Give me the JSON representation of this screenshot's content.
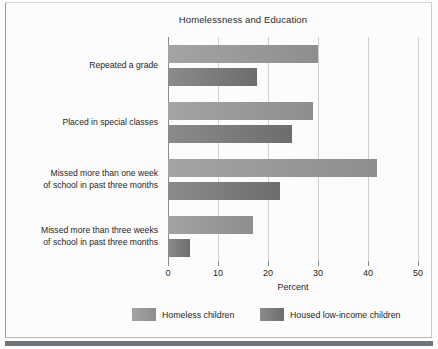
{
  "chart_data": {
    "type": "bar",
    "orientation": "horizontal",
    "title": "Homelessness and Education",
    "xlabel": "Percent",
    "ylabel": "",
    "xlim": [
      0,
      50
    ],
    "xticks": [
      0,
      10,
      20,
      30,
      40,
      50
    ],
    "xtick_labels": [
      "0",
      "10",
      "20",
      "30",
      "40",
      "50"
    ],
    "grid": "vertical",
    "legend_position": "bottom",
    "categories": [
      "Repeated a grade",
      "Placed in special classes",
      "Missed more than one week\nof school in past three months",
      "Missed more than three weeks\nof school in past three months"
    ],
    "category_lines": [
      [
        "Repeated a grade"
      ],
      [
        "Placed in special classes"
      ],
      [
        "Missed more than one week",
        "of school in past three months"
      ],
      [
        "Missed more than three weeks",
        "of school in past three months"
      ]
    ],
    "series": [
      {
        "name": "Homeless children",
        "color": "#9a9a9a",
        "values": [
          30.0,
          29.0,
          41.8,
          17.0
        ]
      },
      {
        "name": "Housed low-income children",
        "color": "#7d7d7d",
        "values": [
          17.8,
          24.8,
          22.4,
          4.4
        ]
      }
    ]
  },
  "legend": {
    "items": [
      {
        "label": "Homeless children",
        "swatch": "light"
      },
      {
        "label": "Housed low-income children",
        "swatch": "dark"
      }
    ]
  },
  "colors": {
    "bar_light": "#9a9a9a",
    "bar_dark": "#7d7d7d",
    "gridline": "#cfcfcf",
    "axis": "#8a8a8a",
    "text": "#1f1f1f",
    "page_rule": "#6f7579"
  }
}
